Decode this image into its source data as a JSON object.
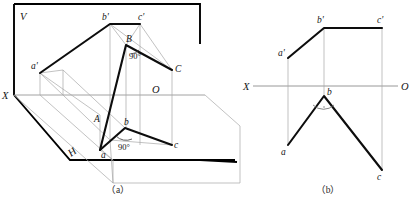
{
  "figure": {
    "captions": [
      {
        "id": "a",
        "text": "（a）"
      },
      {
        "id": "b",
        "text": "（b）"
      }
    ],
    "colors": {
      "ink": "#141414",
      "heavy": "#000000",
      "thin_gray": "#9a9a9a",
      "axis_gray": "#8c8c8c",
      "background": "#ffffff"
    }
  },
  "pictorial": {
    "plane_labels": {
      "vertical_plane": "V",
      "horizontal_plane": "H"
    },
    "axis_labels": {
      "x_axis": "X",
      "origin": "O"
    },
    "space_points": [
      {
        "name": "A",
        "label": "A"
      },
      {
        "name": "B",
        "label": "B"
      },
      {
        "name": "C",
        "label": "C"
      }
    ],
    "front_projection_points": [
      {
        "name": "a-prime",
        "label": "a'"
      },
      {
        "name": "b-prime",
        "label": "b'"
      },
      {
        "name": "c-prime",
        "label": "c'"
      }
    ],
    "top_projection_points": [
      {
        "name": "a",
        "label": "a"
      },
      {
        "name": "b",
        "label": "b"
      },
      {
        "name": "c",
        "label": "c"
      }
    ],
    "angles": [
      {
        "at": "B",
        "label": "90°"
      },
      {
        "at": "b",
        "label": "90°"
      }
    ]
  },
  "orthographic": {
    "axis_labels": {
      "x_axis": "X",
      "origin": "O"
    },
    "front_view_points": [
      {
        "name": "a-prime",
        "label": "a'"
      },
      {
        "name": "b-prime",
        "label": "b'"
      },
      {
        "name": "c-prime",
        "label": "c'"
      }
    ],
    "top_view_points": [
      {
        "name": "a",
        "label": "a"
      },
      {
        "name": "b",
        "label": "b"
      },
      {
        "name": "c",
        "label": "c"
      }
    ]
  }
}
